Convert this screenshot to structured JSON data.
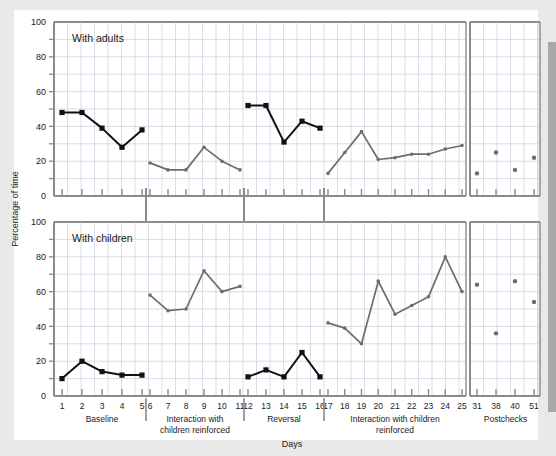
{
  "figure": {
    "ylabel": "Percentage of time",
    "xlabel": "Days",
    "panels": [
      {
        "id": "adults",
        "label": "With adults"
      },
      {
        "id": "children",
        "label": "With children"
      }
    ],
    "phases": [
      {
        "name": "Baseline",
        "line2": ""
      },
      {
        "name": "Interaction with",
        "line2": "children reinforced"
      },
      {
        "name": "Reversal",
        "line2": ""
      },
      {
        "name": "Interaction with children",
        "line2": "reinforced"
      },
      {
        "name": "Postchecks",
        "line2": ""
      }
    ],
    "y_ticks": [
      "0",
      "20",
      "40",
      "60",
      "80",
      "100"
    ],
    "x_ticks_main": [
      "1",
      "2",
      "3",
      "4",
      "5",
      "6",
      "7",
      "8",
      "9",
      "10",
      "11",
      "12",
      "13",
      "14",
      "15",
      "16",
      "17",
      "18",
      "19",
      "20",
      "21",
      "22",
      "23",
      "24",
      "25"
    ],
    "x_ticks_post": [
      "31",
      "38",
      "40",
      "51"
    ],
    "colors": {
      "adults_series": "#111111",
      "children_series": "#6d6d6d",
      "grid": "#c9cfe0",
      "axis": "#8a8a8a",
      "card": "#ffffff",
      "page": "#e9e9e9",
      "right_band": "#a8a8a8"
    }
  },
  "chart_data": {
    "type": "line",
    "title": "",
    "xlabel": "Days",
    "ylabel": "Percentage of time",
    "ylim": [
      0,
      100
    ],
    "grid": true,
    "legend": "none",
    "panels": [
      {
        "name": "With adults",
        "segments": [
          {
            "phase": "Baseline",
            "style": "filled-square-black",
            "x": [
              1,
              2,
              3,
              4,
              5
            ],
            "y": [
              48,
              48,
              39,
              28,
              38
            ]
          },
          {
            "phase": "Interaction with children reinforced",
            "style": "small-dot-gray",
            "x": [
              6,
              7,
              8,
              9,
              10,
              11
            ],
            "y": [
              19,
              15,
              15,
              28,
              20,
              15
            ]
          },
          {
            "phase": "Reversal",
            "style": "filled-square-black",
            "x": [
              12,
              13,
              14,
              15,
              16
            ],
            "y": [
              52,
              52,
              31,
              43,
              39
            ]
          },
          {
            "phase": "Interaction with children reinforced",
            "style": "small-dot-gray",
            "x": [
              17,
              18,
              19,
              20,
              21,
              22,
              23,
              24,
              25
            ],
            "y": [
              13,
              25,
              37,
              21,
              22,
              24,
              24,
              27,
              29
            ]
          },
          {
            "phase": "Postchecks",
            "style": "dots-only-gray",
            "x": [
              31,
              38,
              40,
              51
            ],
            "y": [
              13,
              25,
              15,
              22
            ]
          }
        ]
      },
      {
        "name": "With children",
        "segments": [
          {
            "phase": "Baseline",
            "style": "filled-square-black",
            "x": [
              1,
              2,
              3,
              4,
              5
            ],
            "y": [
              10,
              20,
              14,
              12,
              12
            ]
          },
          {
            "phase": "Interaction with children reinforced",
            "style": "small-dot-gray",
            "x": [
              6,
              7,
              8,
              9,
              10,
              11
            ],
            "y": [
              58,
              49,
              50,
              72,
              60,
              63
            ]
          },
          {
            "phase": "Reversal",
            "style": "filled-square-black",
            "x": [
              12,
              13,
              14,
              15,
              16
            ],
            "y": [
              11,
              15,
              11,
              25,
              11
            ]
          },
          {
            "phase": "Interaction with children reinforced",
            "style": "small-dot-gray",
            "x": [
              17,
              18,
              19,
              20,
              21,
              22,
              23,
              24,
              25
            ],
            "y": [
              42,
              39,
              30,
              66,
              47,
              52,
              57,
              80,
              60
            ]
          },
          {
            "phase": "Postchecks",
            "style": "dots-only-gray",
            "x": [
              31,
              38,
              40,
              51
            ],
            "y": [
              64,
              36,
              66,
              54
            ]
          }
        ]
      }
    ]
  }
}
